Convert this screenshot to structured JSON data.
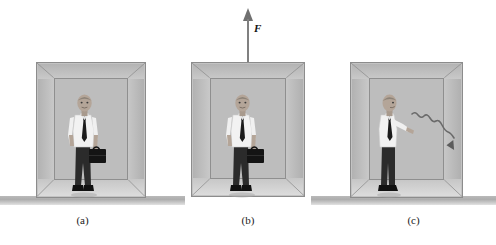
{
  "figure": {
    "width": 496,
    "height": 245,
    "background_color": "#ffffff"
  },
  "colors": {
    "ground": "#b0b0b0",
    "box_wall": "#c6c6c6",
    "box_back_wall": "#bdbdbd",
    "box_outline": "#8c8c8c",
    "shirt": "#f2f2f2",
    "trousers": "#2b2b2b",
    "tie": "#1c1c1c",
    "briefcase": "#141414",
    "skin": "#b4a598",
    "arrow": "#555555",
    "text": "#1a1a1a"
  },
  "panels": [
    {
      "id": "a",
      "caption": "(a)",
      "state": "box resting on the ground",
      "box_on_ground": true,
      "man_pose": "standing, facing viewer, holding briefcase in lowered right hand",
      "has_force_arrow": false,
      "has_throw_trail": false
    },
    {
      "id": "b",
      "caption": "(b)",
      "state": "box lifted off the ground by an upward force",
      "box_on_ground": false,
      "man_pose": "standing, facing viewer, holding briefcase in lowered right hand",
      "has_force_arrow": true,
      "has_throw_trail": false,
      "force": {
        "label": "F",
        "direction": "up",
        "description": "upward applied force on the box"
      }
    },
    {
      "id": "c",
      "caption": "(c)",
      "state": "box resting on the ground, man throws the briefcase",
      "box_on_ground": true,
      "man_pose": "standing in profile facing right, arms extended forward after releasing briefcase",
      "has_force_arrow": false,
      "has_throw_trail": true,
      "throw_trail": {
        "description": "wavy motion trail of the thrown briefcase arcing down and to the right"
      }
    }
  ]
}
